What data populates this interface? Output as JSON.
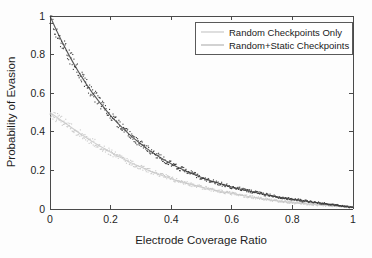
{
  "chart_data": {
    "type": "scatter",
    "title": "",
    "xlabel": "Electrode Coverage Ratio",
    "ylabel": "Probability of Evasion",
    "xlim": [
      0,
      1
    ],
    "ylim": [
      0,
      1
    ],
    "xticks": [
      0,
      0.2,
      0.4,
      0.6,
      0.8,
      1
    ],
    "yticks": [
      0,
      0.2,
      0.4,
      0.6,
      0.8,
      1
    ],
    "xtick_labels": [
      "0",
      "0.2",
      "0.4",
      "0.6",
      "0.8",
      "1"
    ],
    "ytick_labels": [
      "0",
      "0.2",
      "0.4",
      "0.6",
      "0.8",
      "1"
    ],
    "grid": false,
    "legend_position": "upper right",
    "series": [
      {
        "name": "Random Checkpoints Only",
        "color": "#c9c9c9",
        "style": "noisy-line",
        "x": [
          0.0,
          0.02,
          0.04,
          0.06,
          0.08,
          0.1,
          0.12,
          0.14,
          0.16,
          0.18,
          0.2,
          0.22,
          0.24,
          0.26,
          0.28,
          0.3,
          0.32,
          0.34,
          0.36,
          0.38,
          0.4,
          0.42,
          0.44,
          0.46,
          0.48,
          0.5,
          0.52,
          0.54,
          0.56,
          0.58,
          0.6,
          0.65,
          0.7,
          0.75,
          0.8,
          0.85,
          0.9,
          0.95,
          1.0
        ],
        "y": [
          0.5,
          0.478,
          0.456,
          0.434,
          0.412,
          0.39,
          0.369,
          0.349,
          0.33,
          0.312,
          0.294,
          0.277,
          0.261,
          0.245,
          0.231,
          0.217,
          0.203,
          0.191,
          0.179,
          0.168,
          0.157,
          0.147,
          0.138,
          0.129,
          0.121,
          0.113,
          0.106,
          0.099,
          0.092,
          0.086,
          0.081,
          0.066,
          0.053,
          0.042,
          0.033,
          0.026,
          0.02,
          0.015,
          0.01
        ]
      },
      {
        "name": "Random+Static Checkpoints",
        "color": "#3b3b3b",
        "style": "noisy-line",
        "x": [
          0.0,
          0.02,
          0.04,
          0.06,
          0.08,
          0.1,
          0.12,
          0.14,
          0.16,
          0.18,
          0.2,
          0.22,
          0.24,
          0.26,
          0.28,
          0.3,
          0.32,
          0.34,
          0.36,
          0.38,
          0.4,
          0.42,
          0.44,
          0.46,
          0.48,
          0.5,
          0.52,
          0.54,
          0.56,
          0.58,
          0.6,
          0.65,
          0.7,
          0.75,
          0.8,
          0.85,
          0.9,
          0.95,
          1.0
        ],
        "y": [
          1.0,
          0.93,
          0.865,
          0.805,
          0.748,
          0.696,
          0.647,
          0.602,
          0.56,
          0.521,
          0.484,
          0.45,
          0.419,
          0.389,
          0.362,
          0.337,
          0.313,
          0.291,
          0.271,
          0.252,
          0.234,
          0.218,
          0.203,
          0.189,
          0.176,
          0.163,
          0.152,
          0.141,
          0.132,
          0.123,
          0.114,
          0.095,
          0.078,
          0.063,
          0.05,
          0.039,
          0.029,
          0.019,
          0.008
        ]
      }
    ]
  },
  "legend": {
    "entries": [
      {
        "label": "Random Checkpoints Only",
        "color": "#c9c9c9"
      },
      {
        "label": "Random+Static Checkpoints",
        "color": "#b4b4b4"
      }
    ]
  },
  "axes": {
    "x_title": "Electrode Coverage Ratio",
    "y_title": "Probability of Evasion",
    "x_labels": [
      "0",
      "0.2",
      "0.4",
      "0.6",
      "0.8",
      "1"
    ],
    "y_labels": [
      "0",
      "0.2",
      "0.4",
      "0.6",
      "0.8",
      "1"
    ]
  }
}
